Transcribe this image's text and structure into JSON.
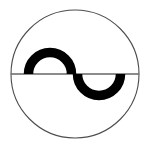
{
  "figure": {
    "canvas": {
      "width": 150,
      "height": 146,
      "background_color": "#ffffff"
    },
    "colors": {
      "outline": "#4d4d4d",
      "diameter_line": "#666666",
      "curve": "#000000",
      "background": "#ffffff"
    },
    "outer_circle": {
      "name": "outer-circle",
      "center_x": 75,
      "center_y": 74,
      "radius": 64,
      "stroke_width": 1.1,
      "fill": "none"
    },
    "diameter_line": {
      "name": "horizontal-diameter",
      "x1": 11,
      "y1": 74,
      "x2": 139,
      "y2": 74,
      "stroke_width": 1.6
    },
    "s_curve": {
      "name": "s-curve",
      "stroke_width": 9.5,
      "upper_arc": {
        "name": "upper-left-arc",
        "center_x": 50,
        "center_y": 74,
        "radius": 21.5,
        "start_angle_deg": 180,
        "end_angle_deg": 360,
        "opens": "downward"
      },
      "lower_arc": {
        "name": "lower-right-arc",
        "center_x": 99,
        "center_y": 74,
        "radius": 21.5,
        "start_angle_deg": 0,
        "end_angle_deg": 180,
        "opens": "upward"
      }
    }
  }
}
